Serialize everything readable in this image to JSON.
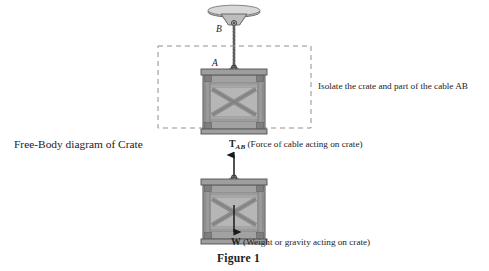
{
  "figure": {
    "caption": "Figure 1",
    "background_color": "#ffffff",
    "ink_color": "#222222"
  },
  "upper_diagram": {
    "description": "Crate suspended by cable AB from a ceiling mount",
    "ceiling_mount": {
      "name": "ceiling-plate"
    },
    "points": [
      {
        "id": "B",
        "label": "B",
        "meaning": "cable attachment at ceiling"
      },
      {
        "id": "A",
        "label": "A",
        "meaning": "cable attachment at crate"
      }
    ],
    "cable": {
      "label": "AB",
      "color": "#6f6f6f"
    },
    "isolation_box": {
      "style": "dashed",
      "color": "#8c8c8c",
      "note": "Isolate the crate and part of the cable AB"
    }
  },
  "lower_diagram": {
    "title": "Free-Body diagram of Crate",
    "forces": [
      {
        "symbol": "T",
        "subscript": "AB",
        "description": "(Force of cable acting on crate)",
        "direction": "up"
      },
      {
        "symbol": "W",
        "subscript": "",
        "description": "(Weight or gravity acting on crate)",
        "direction": "down"
      }
    ]
  },
  "crate": {
    "body_color": "#b4b4b4",
    "frame_color": "#8f8f8f",
    "slat_color": "#a8a8a8",
    "outline_color": "#4a4a4a"
  }
}
